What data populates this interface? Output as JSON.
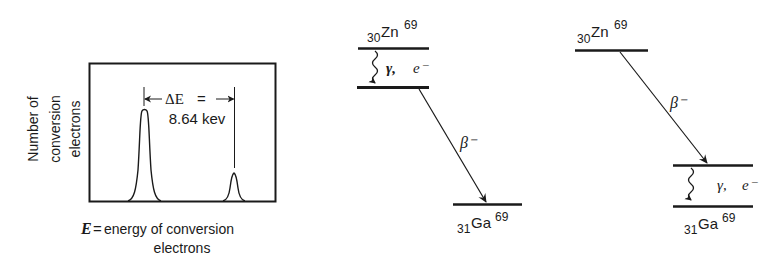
{
  "spectrum_panel": {
    "y_axis_label_lines": [
      "Number of",
      "conversion",
      "electrons"
    ],
    "x_axis_label_symbol": "E",
    "x_axis_label_eq": "=",
    "x_axis_label_line1": "energy of conversion",
    "x_axis_label_line2": "electrons",
    "delta_label": "ΔE",
    "delta_eq": "=",
    "delta_value": "8.64 kev",
    "peaks": [
      {
        "name": "large-peak",
        "relative_height": 1.0
      },
      {
        "name": "small-peak",
        "relative_height": 0.35
      }
    ]
  },
  "scheme_a": {
    "parent_z": "30",
    "parent_symbol": "Zn",
    "parent_a": "69",
    "transition_gamma_label": "γ,",
    "transition_electron_label": "e⁻",
    "beta_label": "β⁻",
    "daughter_z": "31",
    "daughter_symbol": "Ga",
    "daughter_a": "69"
  },
  "scheme_b": {
    "parent_z": "30",
    "parent_symbol": "Zn",
    "parent_a": "69",
    "beta_label": "β⁻",
    "transition_gamma_label": "γ,",
    "transition_electron_label": "e⁻",
    "daughter_z": "31",
    "daughter_symbol": "Ga",
    "daughter_a": "69"
  },
  "colors": {
    "ink": "#1a1a1a",
    "background": "#ffffff"
  }
}
